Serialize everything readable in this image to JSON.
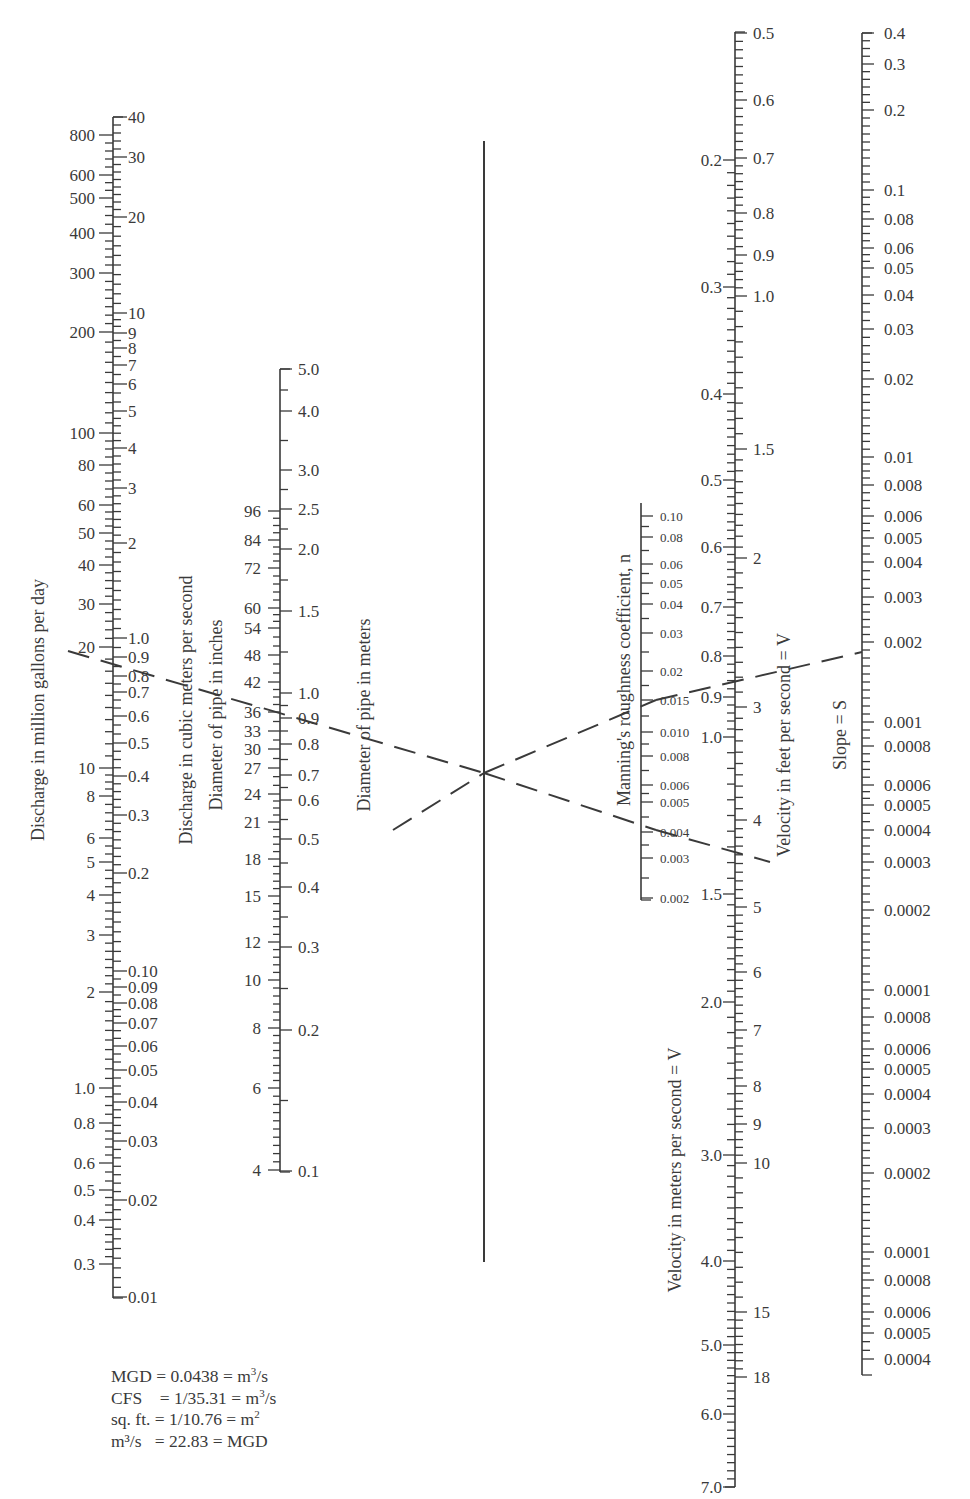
{
  "chart_data": {
    "type": "nomograph",
    "axes": [
      {
        "id": "discharge_mgd",
        "label": "Discharge in million gallons per day",
        "side": "left",
        "scale": "log",
        "range": [
          0.25,
          900
        ],
        "ticks": [
          "800",
          "600",
          "500",
          "400",
          "300",
          "200",
          "100",
          "80",
          "60",
          "50",
          "40",
          "30",
          "20",
          "10",
          "8",
          "6",
          "5",
          "4",
          "3",
          "2",
          "1.0",
          "0.8",
          "0.6",
          "0.5",
          "0.4",
          "0.3"
        ]
      },
      {
        "id": "discharge_cms",
        "label": "Discharge in cubic meters per second",
        "side": "right",
        "scale": "log",
        "range": [
          0.01,
          40
        ],
        "ticks": [
          "40",
          "30",
          "20",
          "10",
          "9",
          "8",
          "7",
          "6",
          "5",
          "4",
          "3",
          "2",
          "1.0",
          "0.9",
          "0.8",
          "0.7",
          "0.6",
          "0.5",
          "0.4",
          "0.3",
          "0.2",
          "0.10",
          "0.09",
          "0.08",
          "0.07",
          "0.06",
          "0.05",
          "0.04",
          "0.03",
          "0.02",
          "0.01"
        ]
      },
      {
        "id": "diameter_in",
        "label": "Diameter of pipe in inches",
        "side": "left",
        "scale": "log",
        "range": [
          4,
          96
        ],
        "ticks": [
          "96",
          "84",
          "72",
          "60",
          "54",
          "48",
          "42",
          "36",
          "33",
          "30",
          "27",
          "24",
          "21",
          "18",
          "15",
          "12",
          "10",
          "8",
          "6",
          "4"
        ]
      },
      {
        "id": "diameter_m",
        "label": "Diameter of pipe in meters",
        "side": "right",
        "scale": "log",
        "range": [
          0.1,
          5.0
        ],
        "ticks": [
          "5.0",
          "4.0",
          "3.0",
          "2.5",
          "2.0",
          "1.5",
          "1.0",
          "0.9",
          "0.8",
          "0.7",
          "0.6",
          "0.5",
          "0.4",
          "0.3",
          "0.2",
          "0.1"
        ]
      },
      {
        "id": "pivot",
        "label": "",
        "side": "none",
        "scale": "none",
        "ticks": []
      },
      {
        "id": "manning_n",
        "label": "Manning's roughness coefficient, n",
        "side": "right",
        "scale": "log",
        "range": [
          0.002,
          0.1
        ],
        "ticks": [
          "0.10",
          "0.08",
          "0.06",
          "0.05",
          "0.04",
          "0.03",
          "0.02",
          "0.015",
          "0.010",
          "0.008",
          "0.006",
          "0.005",
          "0.004",
          "0.003",
          "0.002"
        ]
      },
      {
        "id": "velocity_ms",
        "label": "Velocity in meters per second = V",
        "side": "left",
        "scale": "log",
        "range": [
          0.15,
          7.0
        ],
        "ticks": [
          "0.2",
          "0.3",
          "0.4",
          "0.5",
          "0.6",
          "0.7",
          "0.8",
          "0.9",
          "1.0",
          "1.5",
          "2.0",
          "3.0",
          "4.0",
          "5.0",
          "6.0",
          "7.0"
        ]
      },
      {
        "id": "velocity_fps",
        "label": "Velocity in feet per second = V",
        "side": "right",
        "scale": "log",
        "range": [
          0.5,
          18
        ],
        "ticks": [
          "0.5",
          "0.6",
          "0.7",
          "0.8",
          "0.9",
          "1.0",
          "1.5",
          "2",
          "3",
          "4",
          "5",
          "6",
          "7",
          "8",
          "9",
          "10",
          "15",
          "18"
        ]
      },
      {
        "id": "slope",
        "label": "Slope = S",
        "side": "right",
        "scale": "log",
        "range": [
          4e-05,
          0.4
        ],
        "ticks": [
          "0.4",
          "0.3",
          "0.2",
          "0.1",
          "0.08",
          "0.06",
          "0.05",
          "0.04",
          "0.03",
          "0.02",
          "0.01",
          "0.008",
          "0.006",
          "0.005",
          "0.004",
          "0.003",
          "0.002",
          "0.001",
          "0.0008",
          "0.0006",
          "0.0005",
          "0.0004",
          "0.0003",
          "0.0002",
          "0.0001",
          "0.0008",
          "0.0006",
          "0.0005",
          "0.0004",
          "0.0003",
          "0.0002",
          "0.0001",
          "0.0008",
          "0.0006",
          "0.0005",
          "0.0004"
        ]
      }
    ],
    "example_solution": {
      "discharge_mgd": 20,
      "discharge_cms": 0.85,
      "diameter_in": 36,
      "diameter_m": 0.9,
      "manning_n": 0.013,
      "velocity_ms": 0.88,
      "velocity_fps": 2.9,
      "slope": 0.0019
    }
  },
  "conversions": [
    {
      "lhs": "MGD",
      "mid": " = 0.0438 = ",
      "rhs": "m",
      "sup": "3",
      "tail": "/s"
    },
    {
      "lhs": "CFS   ",
      "mid": " = 1/35.31 = ",
      "rhs": "m",
      "sup": "3",
      "tail": "/s"
    },
    {
      "lhs": "sq. ft.",
      "mid": " = 1/10.76 = ",
      "rhs": "m",
      "sup": "2",
      "tail": ""
    },
    {
      "lhs": "m³/s  ",
      "mid": " = 22.83 = ",
      "rhs": "MGD",
      "sup": "",
      "tail": ""
    }
  ]
}
